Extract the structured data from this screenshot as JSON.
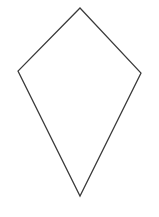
{
  "canvas": {
    "width": 159,
    "height": 217,
    "background_color": "#ffffff",
    "has_border": false,
    "title": "kite-shape-line-drawing"
  },
  "figure": {
    "name": "kite",
    "alt_names": [
      "kite quadrilateral",
      "dart",
      "diamond-kite outline"
    ],
    "type": "closed-polygon-outline",
    "fill": "none",
    "fill_color": "#ffffff",
    "stroke_color": "#3a3a3a",
    "stroke_width": 1.25,
    "vertex_count": 4,
    "vertices": [
      {
        "name": "top-apex",
        "x": 80,
        "y": 8
      },
      {
        "name": "right-vertex",
        "x": 141,
        "y": 73
      },
      {
        "name": "bottom-apex",
        "x": 80,
        "y": 196
      },
      {
        "name": "left-vertex",
        "x": 18,
        "y": 71
      }
    ],
    "points_attribute": "80,8 141,73 80,196 18,71",
    "edges": [
      {
        "name": "upper-right-edge",
        "from": "top-apex",
        "to": "right-vertex"
      },
      {
        "name": "lower-right-edge",
        "from": "right-vertex",
        "to": "bottom-apex"
      },
      {
        "name": "lower-left-edge",
        "from": "bottom-apex",
        "to": "left-vertex"
      },
      {
        "name": "upper-left-edge",
        "from": "left-vertex",
        "to": "top-apex"
      }
    ]
  },
  "labels": {
    "has_text": false,
    "text_items": []
  }
}
